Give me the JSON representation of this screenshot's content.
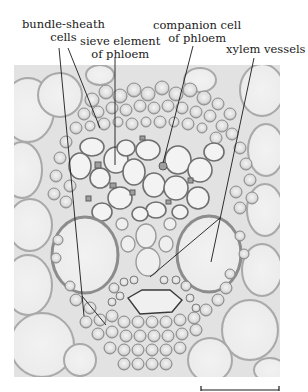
{
  "figure": {
    "type": "micrograph",
    "labels": {
      "bundle_sheath": {
        "line1": "bundle-sheath",
        "line2": "cells"
      },
      "sieve_element": {
        "line1": "sieve element",
        "line2": "of phloem"
      },
      "companion_cell": {
        "line1": "companion cell",
        "line2": "of phloem"
      },
      "xylem": {
        "line1": "xylem vessels"
      }
    },
    "scale_bar": {
      "label": ""
    }
  },
  "colors": {
    "background": "#ffffff",
    "tissue_bg": "#e4e4e4",
    "cell_fill": "#f1f1f1",
    "cell_wall": "#a8a8a8",
    "dense_cell": "#c9c9c9",
    "leader_line": "#1a1a1a"
  }
}
